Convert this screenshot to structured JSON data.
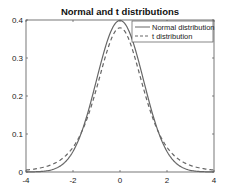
{
  "chart_data": {
    "type": "line",
    "title": "Normal and t distributions",
    "xlabel": "",
    "ylabel": "",
    "xlim": [
      -4,
      4
    ],
    "ylim": [
      0,
      0.4
    ],
    "xticks": [
      "-4",
      "-2",
      "0",
      "2",
      "4"
    ],
    "yticks": [
      "0",
      "0.1",
      "0.2",
      "0.3",
      "0.4"
    ],
    "grid": false,
    "legend_position": "upper right",
    "series": [
      {
        "name": "Normal distribution",
        "style": "solid",
        "color": "#666666",
        "x": [
          -4,
          -3.5,
          -3,
          -2.5,
          -2,
          -1.5,
          -1,
          -0.5,
          0,
          0.5,
          1,
          1.5,
          2,
          2.5,
          3,
          3.5,
          4
        ],
        "y": [
          0.0001,
          0.0009,
          0.0044,
          0.0175,
          0.054,
          0.1295,
          0.242,
          0.3521,
          0.3989,
          0.3521,
          0.242,
          0.1295,
          0.054,
          0.0175,
          0.0044,
          0.0009,
          0.0001
        ]
      },
      {
        "name": "t distribution",
        "style": "dashed",
        "color": "#666666",
        "x": [
          -4,
          -3.5,
          -3,
          -2.5,
          -2,
          -1.5,
          -1,
          -0.5,
          0,
          0.5,
          1,
          1.5,
          2,
          2.5,
          3,
          3.5,
          4
        ],
        "y": [
          0.0051,
          0.0087,
          0.0155,
          0.0297,
          0.0612,
          0.1286,
          0.2336,
          0.3334,
          0.3796,
          0.3334,
          0.2336,
          0.1286,
          0.0612,
          0.0297,
          0.0155,
          0.0087,
          0.0051
        ]
      }
    ]
  }
}
